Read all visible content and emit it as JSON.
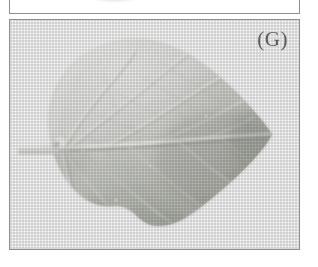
{
  "figure": {
    "kind": "photographic-figure-plate",
    "background_color": "#ffffff",
    "panel_border_color": "#8e8e8e",
    "panels": [
      {
        "id": "panel-above",
        "label": "",
        "state": "clipped-at-top-edge",
        "description": "bottom sliver of the preceding figure panel, showing a faint dark smudge of a cropped specimen"
      },
      {
        "id": "panel-g",
        "label": "(G)",
        "description": "grayscale halftone photograph of a single broad cordate leaf, abaxial surface, petiole to the left and apex to the right"
      }
    ]
  },
  "panel_g": {
    "label": "(G)",
    "caption_letter": "G",
    "photo": {
      "name": "leaf-photograph",
      "subject": "broad ovate-cordate leaf",
      "orientation": "petiole at left, apex at right",
      "tone": "grayscale halftone print scan",
      "leaf_fill_light": "#e9eae6",
      "leaf_fill_mid": "#cfd1cb",
      "leaf_fill_dark": "#b9bbb4",
      "vein_highlight": "#f2f2ee",
      "vein_shadow": "#a9aba4",
      "petiole_color": "#e4e5e1",
      "background_color": "#ffffff",
      "features": [
        "petiole",
        "midrib",
        "lateral-veins",
        "reticulate-venation",
        "undulate-margin",
        "basal-lobes"
      ]
    }
  }
}
